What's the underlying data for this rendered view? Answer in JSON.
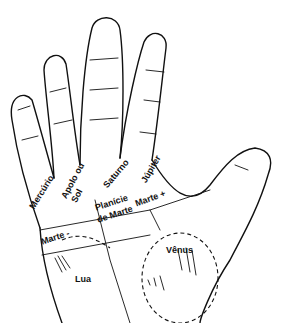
{
  "diagram": {
    "type": "palmistry hand mounts diagram",
    "colors": {
      "ink": "#111111",
      "background": "#ffffff"
    },
    "labels": {
      "mercurio": "Mercúrio",
      "apolo": "Apolo ou",
      "sol": "Sol",
      "saturno": "Saturno",
      "jupiter": "Júpiter",
      "planicie": "Planície",
      "de_marte": "de Marte",
      "marte_plus": "Marte +",
      "marte_minus": "Marte -",
      "venus": "Vênus",
      "lua": "Lua"
    }
  }
}
